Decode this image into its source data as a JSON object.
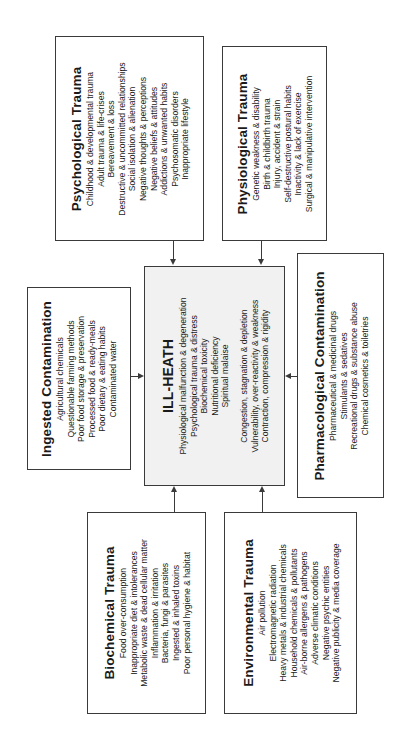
{
  "diagram": {
    "center": {
      "title": "ILL-HEATH",
      "items_group1": [
        "Physiological malfunction & degeneration",
        "Psychological trauma & distress",
        "Biochemical toxicity",
        "Nutritional deficiency",
        "Spiritual malaise"
      ],
      "items_group2": [
        "Congestion, stagnation & depletion",
        "Vulnerability, over-reactivity & weakness",
        "Contraction, compression & rigidity"
      ]
    },
    "psychological": {
      "title": "Psychological Trauma",
      "items": [
        "Childhood & developmental trauma",
        "Adult trauma & life-crises",
        "Bereavement & loss",
        "Destructive & uncommitted relationships",
        "Social isolation & alienation",
        "Negative thoughts & perceptions",
        "Negative beliefs & attitudes",
        "Addictions & unwanted habits",
        "Psychosomatic disorders",
        "Inappropriate lifestyle"
      ]
    },
    "physiological": {
      "title": "Physiological Trauma",
      "items": [
        "Genetic weakness & disability",
        "Birth & childbirth trauma",
        "Injury, accident & strain",
        "Self-destructive postural habits",
        "Inactivity & lack of exercise",
        "Surgical & manipulative intervention"
      ]
    },
    "ingested": {
      "title": "Ingested Contamination",
      "items": [
        "Agricultural chemicals",
        "Questionable farming methods",
        "Poor food storage & preservation",
        "Processed food & ready-meals",
        "Poor dietary & eating habits",
        "Contaminated water"
      ]
    },
    "pharmacological": {
      "title": "Pharmacological Contamination",
      "items": [
        "Pharmaceutical & medicinal drugs",
        "Stimulants & sedatives",
        "Recreational drugs & substance abuse",
        "Chemical cosmetics & toiletries"
      ]
    },
    "biochemical": {
      "title": "Biochemical Trauma",
      "items": [
        "Food over-consumption",
        "Inappropriate diet & intolerances",
        "Metabolic waste & dead cellular matter",
        "Inflammation & irritation",
        "Bacteria, fungi & parasites",
        "Ingested & inhaled toxins",
        "Poor personal hygiene & habitat"
      ]
    },
    "environmental": {
      "title": "Environmental Trauma",
      "items": [
        "Air pollution",
        "Electromagnetic radiation",
        "Heavy metals & industrial chemicals",
        "Household chemicals & pollutants",
        "Air-borne allergens & pathogens",
        "Adverse climatic conditions",
        "Negative psychic entities",
        "Negative publicity & media coverage"
      ]
    },
    "colors": {
      "border": "#3a3a3a",
      "center_fill": "#f1f1f1",
      "box_fill": "#ffffff",
      "text": "#1a1a1a"
    }
  }
}
